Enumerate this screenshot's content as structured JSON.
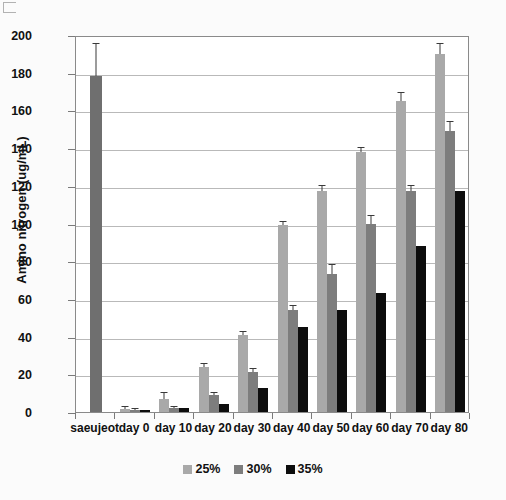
{
  "chart_data": {
    "type": "bar",
    "title": "",
    "xlabel": "",
    "ylabel": "Amino nitrogen (ug/mL)",
    "ylim": [
      0,
      200
    ],
    "ytick_step": 20,
    "yticks": [
      "0",
      "20",
      "40",
      "60",
      "80",
      "100",
      "120",
      "140",
      "160",
      "180",
      "200"
    ],
    "grid": true,
    "legend_position": "bottom-center",
    "categories": [
      "saeujeot",
      "day 0",
      "day 10",
      "day 20",
      "day 30",
      "day 40",
      "day 50",
      "day 60",
      "day 70",
      "day 80"
    ],
    "series": [
      {
        "name": "25%",
        "color": "#a9a9a9",
        "values": [
          178,
          1.5,
          7,
          24,
          41,
          99,
          117,
          138,
          165,
          190
        ],
        "errors": [
          17,
          1,
          3,
          1.5,
          1.5,
          2,
          3,
          2,
          4,
          5
        ]
      },
      {
        "name": "30%",
        "color": "#7d7d7d",
        "values": [
          null,
          1.2,
          2,
          9,
          21,
          54,
          73,
          100,
          117,
          149
        ],
        "errors": [
          null,
          0.5,
          0.8,
          1,
          2,
          2,
          5,
          4,
          3,
          5
        ]
      },
      {
        "name": "35%",
        "color": "#0d0d0d",
        "values": [
          null,
          1,
          2,
          4,
          13,
          45,
          54,
          63,
          88,
          117
        ]
      }
    ],
    "reference_bar": {
      "category": "saeujeot",
      "value": 178,
      "error": 17,
      "color": "#6f6f6f"
    }
  },
  "axis": {
    "y_title": "Amino nitrogen (ug/mL)"
  },
  "legend": {
    "items": [
      {
        "label": "25%",
        "color": "#a9a9a9"
      },
      {
        "label": "30%",
        "color": "#7d7d7d"
      },
      {
        "label": "35%",
        "color": "#0d0d0d"
      }
    ]
  }
}
